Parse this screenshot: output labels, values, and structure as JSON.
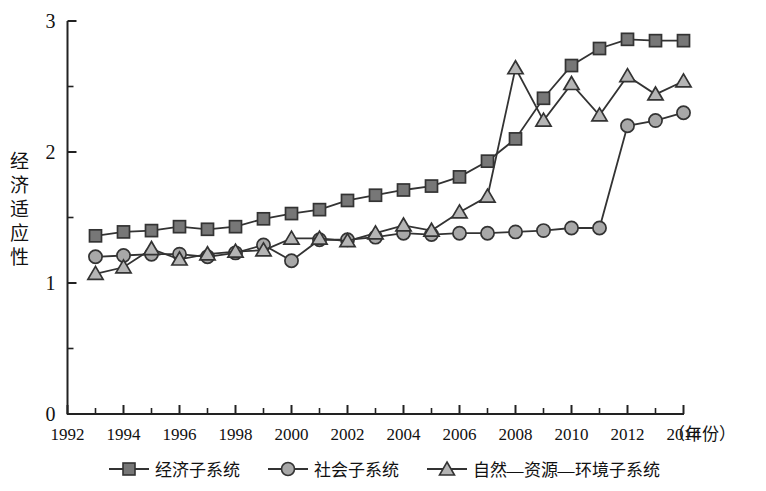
{
  "chart_data": {
    "type": "line",
    "title": "",
    "xlabel": "（年份）",
    "ylabel": "经济适应性",
    "x": [
      1993,
      1994,
      1995,
      1996,
      1997,
      1998,
      1999,
      2000,
      2001,
      2002,
      2003,
      2004,
      2005,
      2006,
      2007,
      2008,
      2009,
      2010,
      2011,
      2012,
      2013,
      2014
    ],
    "xlim": [
      1992,
      2014
    ],
    "ylim": [
      0,
      3
    ],
    "xticks": [
      1992,
      1994,
      1996,
      1998,
      2000,
      2002,
      2004,
      2006,
      2008,
      2010,
      2012,
      2014
    ],
    "xticklabels": [
      "1992",
      "1994",
      "1996",
      "1998",
      "2000",
      "2002",
      "2004",
      "2006",
      "2008",
      "2010",
      "2012",
      "2014"
    ],
    "yticks": [
      0,
      1,
      2,
      3
    ],
    "yticklabels": [
      "0",
      "1",
      "2",
      "3"
    ],
    "yminorticks": [
      0.5,
      1.5,
      2.5
    ],
    "grid": false,
    "legend_position": "bottom",
    "series": [
      {
        "name": "经济子系统",
        "marker": "square",
        "color": "#777777",
        "line_color": "#333333",
        "values": [
          1.36,
          1.39,
          1.4,
          1.43,
          1.41,
          1.43,
          1.49,
          1.53,
          1.56,
          1.63,
          1.67,
          1.71,
          1.74,
          1.81,
          1.93,
          2.1,
          2.41,
          2.66,
          2.79,
          2.86,
          2.85,
          2.85
        ]
      },
      {
        "name": "社会子系统",
        "marker": "circle",
        "color": "#a8a8a8",
        "line_color": "#333333",
        "values": [
          1.2,
          1.21,
          1.22,
          1.22,
          1.2,
          1.23,
          1.29,
          1.17,
          1.33,
          1.33,
          1.35,
          1.38,
          1.37,
          1.38,
          1.38,
          1.39,
          1.4,
          1.42,
          1.42,
          2.2,
          2.24,
          2.3
        ]
      },
      {
        "name": "自然—资源—环境子系统",
        "marker": "triangle",
        "color": "#b5b5b5",
        "line_color": "#333333",
        "values": [
          1.07,
          1.12,
          1.26,
          1.18,
          1.22,
          1.24,
          1.25,
          1.34,
          1.34,
          1.32,
          1.38,
          1.44,
          1.4,
          1.54,
          1.66,
          2.64,
          2.24,
          2.52,
          2.28,
          2.58,
          2.44,
          2.54
        ]
      }
    ]
  },
  "legend": {
    "items": [
      {
        "label": "经济子系统",
        "marker": "square"
      },
      {
        "label": "社会子系统",
        "marker": "circle"
      },
      {
        "label": "自然—资源—环境子系统",
        "marker": "triangle"
      }
    ]
  },
  "axes": {
    "y_axis_title_chars": [
      "经",
      "济",
      "适",
      "应",
      "性"
    ],
    "x_axis_unit": "（年份）"
  }
}
